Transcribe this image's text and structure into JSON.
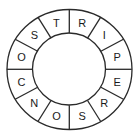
{
  "diagram": {
    "type": "letter-ring",
    "segments": 12,
    "letters": [
      "T",
      "R",
      "I",
      "P",
      "E",
      "R",
      "S",
      "O",
      "N",
      "C",
      "O",
      "S"
    ],
    "reading_order": "clockwise from top",
    "colors": {
      "line": "#2a2a2a",
      "text": "#1a1a1a",
      "background": "#ffffff"
    }
  }
}
